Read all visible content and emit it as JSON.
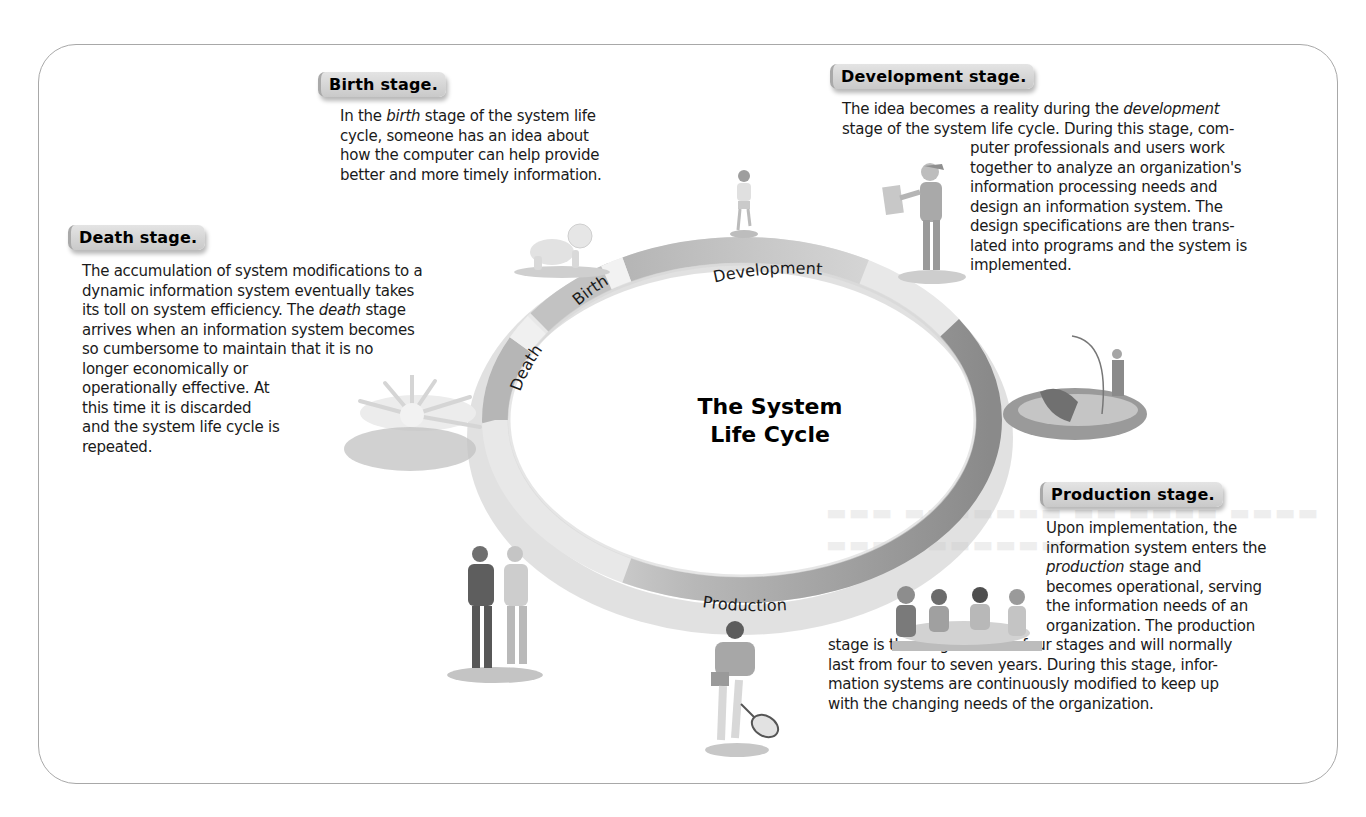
{
  "diagram": {
    "center_title": [
      "The System",
      "Life Cycle"
    ],
    "ring_segments": [
      {
        "label": "Birth",
        "color": "#c4c4c4"
      },
      {
        "label": "Development",
        "color": "#a6a6a6"
      },
      {
        "label": "Production",
        "color": "#8c8c8c"
      },
      {
        "label": "Death",
        "color": "#b4b4b4"
      }
    ],
    "ring_colors": {
      "light": "#e9e9e9",
      "medium": "#b9b9b9",
      "dark": "#8a8a8a",
      "shadow": "#9a9a9a",
      "frame_border": "#a8a8a8"
    }
  },
  "stages": {
    "birth": {
      "title": "Birth stage.",
      "lines": [
        {
          "pre": "In the ",
          "em": "birth",
          "post": " stage of the system life"
        },
        {
          "pre": "cycle, someone has an idea about",
          "em": "",
          "post": ""
        },
        {
          "pre": "how the computer can help provide",
          "em": "",
          "post": ""
        },
        {
          "pre": "better and more timely information.",
          "em": "",
          "post": ""
        }
      ]
    },
    "development": {
      "title": "Development stage.",
      "lines": [
        {
          "pre": "The idea becomes a reality during the ",
          "em": "development",
          "post": ""
        },
        {
          "pre": "stage of the system life cycle. During this stage, com-",
          "em": "",
          "post": ""
        },
        {
          "pre": "puter professionals and users work",
          "em": "",
          "post": ""
        },
        {
          "pre": "together to analyze an organization's",
          "em": "",
          "post": ""
        },
        {
          "pre": "information processing needs and",
          "em": "",
          "post": ""
        },
        {
          "pre": "design an information system. The",
          "em": "",
          "post": ""
        },
        {
          "pre": "design specifications are then trans-",
          "em": "",
          "post": ""
        },
        {
          "pre": "lated into programs and the system is",
          "em": "",
          "post": ""
        },
        {
          "pre": "implemented.",
          "em": "",
          "post": ""
        }
      ]
    },
    "death": {
      "title": "Death stage.",
      "lines": [
        {
          "pre": "The accumulation of system modifications to a",
          "em": "",
          "post": ""
        },
        {
          "pre": "dynamic information system eventually takes",
          "em": "",
          "post": ""
        },
        {
          "pre": "its toll on system efficiency. The ",
          "em": "death",
          "post": " stage"
        },
        {
          "pre": "arrives when an information system becomes",
          "em": "",
          "post": ""
        },
        {
          "pre": "so cumbersome to maintain that it is no",
          "em": "",
          "post": ""
        },
        {
          "pre": "longer economically or",
          "em": "",
          "post": ""
        },
        {
          "pre": "operationally effective. At",
          "em": "",
          "post": ""
        },
        {
          "pre": "this time it is discarded",
          "em": "",
          "post": ""
        },
        {
          "pre": "and the system life cycle is",
          "em": "",
          "post": ""
        },
        {
          "pre": "repeated.",
          "em": "",
          "post": ""
        }
      ]
    },
    "production": {
      "title": "Production stage.",
      "lines": [
        {
          "pre": "Upon implementation, the",
          "em": "",
          "post": ""
        },
        {
          "pre": "information system enters the",
          "em": "",
          "post": ""
        },
        {
          "pre": "",
          "em": "production",
          "post": " stage and"
        },
        {
          "pre": "becomes operational, serving",
          "em": "",
          "post": ""
        },
        {
          "pre": "the information needs of an",
          "em": "",
          "post": ""
        },
        {
          "pre": "organization. The production",
          "em": "",
          "post": ""
        },
        {
          "pre": "stage is the longest of the four stages and will normally",
          "em": "",
          "post": ""
        },
        {
          "pre": "last from four to seven years. During this stage, infor-",
          "em": "",
          "post": ""
        },
        {
          "pre": "mation systems are continuously modified to keep up",
          "em": "",
          "post": ""
        },
        {
          "pre": "with the changing needs of the organization.",
          "em": "",
          "post": ""
        }
      ]
    }
  },
  "illustrations": [
    {
      "name": "crawling-baby",
      "stage": "birth"
    },
    {
      "name": "walking-toddler",
      "stage": "birth"
    },
    {
      "name": "student-with-cap",
      "stage": "development"
    },
    {
      "name": "fisherman-boat",
      "stage": "development"
    },
    {
      "name": "meeting-table",
      "stage": "production"
    },
    {
      "name": "tennis-player",
      "stage": "production"
    },
    {
      "name": "walking-couple",
      "stage": "production"
    },
    {
      "name": "setting-sun",
      "stage": "death"
    }
  ]
}
